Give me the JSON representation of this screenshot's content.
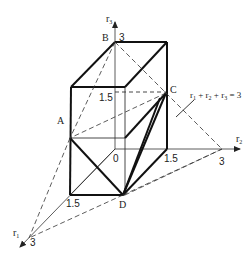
{
  "figure": {
    "points": {
      "A": "A",
      "B": "B",
      "C": "C",
      "D": "D",
      "origin": "0"
    },
    "axes": {
      "r1": {
        "label": "r",
        "sub": "1",
        "end_value": "3",
        "mid_value": "1.5"
      },
      "r2": {
        "label": "r",
        "sub": "2",
        "end_value": "3",
        "mid_value": "1.5"
      },
      "r3": {
        "label": "r",
        "sub": "3",
        "end_value": "3",
        "mid_value": "1.5"
      }
    },
    "plane_equation": {
      "t1": "r",
      "s1": "1",
      "p1": " + ",
      "t2": "r",
      "s2": "2",
      "p2": " + ",
      "t3": "r",
      "s3": "3",
      "eq": " = 3"
    }
  }
}
